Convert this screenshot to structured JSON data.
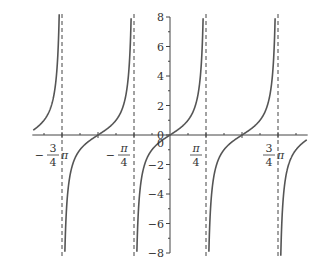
{
  "chart_data": {
    "type": "line",
    "title": "",
    "function": "y = tan(2x)",
    "xlabel": "",
    "ylabel": "",
    "xlim_pi": [
      -0.97,
      0.97
    ],
    "ylim": [
      -8,
      8
    ],
    "grid": false,
    "legend": null,
    "x_ticks": [
      {
        "value_pi": -0.75,
        "label": "-3/4 π",
        "labeled": true
      },
      {
        "value_pi": -0.5,
        "label": "",
        "labeled": false
      },
      {
        "value_pi": -0.25,
        "label": "-π/4",
        "labeled": true
      },
      {
        "value_pi": 0,
        "label": "0",
        "labeled": true
      },
      {
        "value_pi": 0.25,
        "label": "π/4",
        "labeled": true
      },
      {
        "value_pi": 0.5,
        "label": "",
        "labeled": false
      },
      {
        "value_pi": 0.75,
        "label": "3/4 π",
        "labeled": true
      }
    ],
    "y_ticks": [
      -8,
      -6,
      -4,
      -2,
      0,
      2,
      4,
      6,
      8
    ],
    "y_tick_labels": [
      "−8",
      "−6",
      "−4",
      "−2",
      "0",
      "2",
      "4",
      "6",
      "8"
    ],
    "asymptotes_pi": [
      -0.75,
      -0.25,
      0.25,
      0.75
    ],
    "zeros_pi": [
      -0.5,
      0,
      0.5
    ],
    "series": [
      {
        "name": "tan(2x)",
        "x_pi": [
          -0.95,
          -0.875,
          -0.8,
          -0.76,
          -0.74,
          -0.7,
          -0.625,
          -0.5,
          -0.375,
          -0.3,
          -0.26,
          -0.24,
          -0.2,
          -0.125,
          0,
          0.125,
          0.2,
          0.24,
          0.26,
          0.3,
          0.375,
          0.5,
          0.625,
          0.7,
          0.74,
          0.76,
          0.8,
          0.875,
          0.95
        ],
        "y": [
          0.32,
          1,
          3.08,
          15.9,
          -15.9,
          -3.08,
          -1,
          0,
          1,
          3.08,
          15.9,
          -15.9,
          -3.08,
          -1,
          0,
          1,
          3.08,
          15.9,
          -15.9,
          -3.08,
          -1,
          0,
          1,
          3.08,
          15.9,
          -15.9,
          -3.08,
          -1,
          -0.32
        ]
      }
    ],
    "colors": {
      "curve": "#555555",
      "axis": "#444444",
      "asymptote": "#444444"
    }
  }
}
